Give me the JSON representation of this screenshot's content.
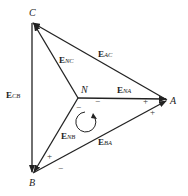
{
  "diagram": {
    "vertices": {
      "A": "A",
      "B": "B",
      "C": "C",
      "N": "N"
    },
    "edges": [
      {
        "id": "AC",
        "symbol": "E",
        "sub": "AC"
      },
      {
        "id": "CB",
        "symbol": "E",
        "sub": "CB"
      },
      {
        "id": "BA",
        "symbol": "E",
        "sub": "BA"
      },
      {
        "id": "NC",
        "symbol": "E",
        "sub": "NC"
      },
      {
        "id": "NA",
        "symbol": "E",
        "sub": "NA"
      },
      {
        "id": "NB",
        "symbol": "E",
        "sub": "NB"
      }
    ],
    "signs": {
      "plus": "+",
      "minus": "−"
    }
  }
}
